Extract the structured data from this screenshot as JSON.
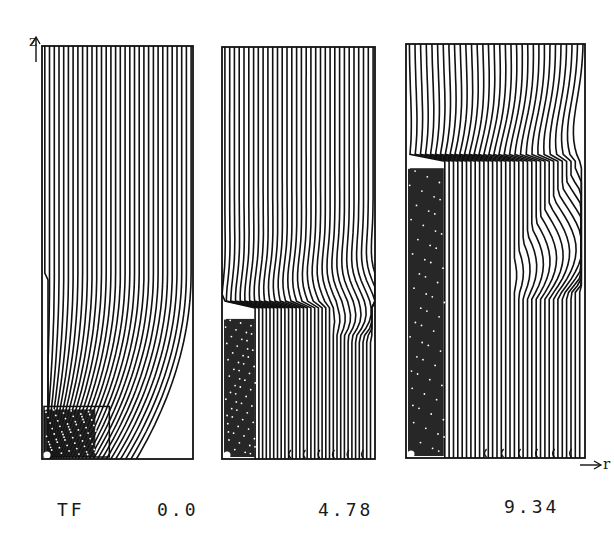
{
  "figure": {
    "row_label": "TF",
    "axis_z": "z",
    "axis_r": "r",
    "panels": [
      {
        "time_label": "0.0",
        "x0": 42,
        "y0": 46,
        "x1": 193,
        "y1": 459,
        "stage": 0
      },
      {
        "time_label": "4.78",
        "x0": 222,
        "y0": 47,
        "x1": 375,
        "y1": 459,
        "stage": 1
      },
      {
        "time_label": "9.34",
        "x0": 406,
        "y0": 44,
        "x1": 585,
        "y1": 458,
        "stage": 2
      }
    ],
    "line_count": 32,
    "line_color": "#111111"
  }
}
